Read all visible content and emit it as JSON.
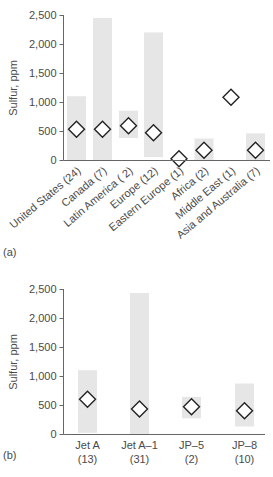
{
  "chart_data": [
    {
      "panel": "(a)",
      "type": "range-bar-with-marker",
      "title": "",
      "xlabel": "",
      "ylabel": "Sulfur, ppm",
      "ylim": [
        0,
        2500
      ],
      "yticks": [
        "0",
        "500",
        "1,000",
        "1,500",
        "2,000",
        "2,500"
      ],
      "yticks_values": [
        0,
        500,
        1000,
        1500,
        2000,
        2500
      ],
      "grid": false,
      "categories": [
        "United States (24)",
        "Canada (7)",
        "Latin America ( 2)",
        "Europe (12)",
        "Eastern Europe (1)",
        "Africa (2)",
        "Middle East (1)",
        "Asia and Australia (7)"
      ],
      "series": [
        {
          "name": "range_min",
          "values": [
            0,
            0,
            380,
            50,
            null,
            0,
            null,
            0
          ]
        },
        {
          "name": "range_max",
          "values": [
            1100,
            2450,
            850,
            2200,
            null,
            370,
            null,
            460
          ]
        },
        {
          "name": "average",
          "values": [
            530,
            530,
            590,
            470,
            20,
            170,
            1080,
            170
          ]
        }
      ]
    },
    {
      "panel": "(b)",
      "type": "range-bar-with-marker",
      "title": "",
      "xlabel": "",
      "ylabel": "Sulfur, ppm",
      "ylim": [
        0,
        2500
      ],
      "yticks": [
        "0",
        "500",
        "1,000",
        "1,500",
        "2,000",
        "2,500"
      ],
      "yticks_values": [
        0,
        500,
        1000,
        1500,
        2000,
        2500
      ],
      "grid": false,
      "categories": [
        "Jet A (13)",
        "Jet A–1 (31)",
        "JP–5 (2)",
        "JP–8 (10)"
      ],
      "category_lines": [
        [
          "Jet A",
          "(13)"
        ],
        [
          "Jet A–1",
          "(31)"
        ],
        [
          "JP–5",
          "(2)"
        ],
        [
          "JP–8",
          "(10)"
        ]
      ],
      "series": [
        {
          "name": "range_min",
          "values": [
            20,
            0,
            270,
            130
          ]
        },
        {
          "name": "range_max",
          "values": [
            1100,
            2430,
            640,
            870
          ]
        },
        {
          "name": "average",
          "values": [
            600,
            430,
            470,
            400
          ]
        }
      ]
    }
  ],
  "panels": {
    "a": {
      "label": "(a)",
      "ylabel": "Sulfur, ppm",
      "ytick_labels": [
        "0",
        "500",
        "1,000",
        "1,500",
        "2,000",
        "2,500"
      ],
      "categories": [
        "United States (24)",
        "Canada (7)",
        "Latin America ( 2)",
        "Europe (12)",
        "Eastern Europe (1)",
        "Africa (2)",
        "Middle East (1)",
        "Asia and Australia (7)"
      ]
    },
    "b": {
      "label": "(b)",
      "ylabel": "Sulfur, ppm",
      "ytick_labels": [
        "0",
        "500",
        "1,000",
        "1,500",
        "2,000",
        "2,500"
      ],
      "categories_line1": [
        "Jet A",
        "Jet A–1",
        "JP–5",
        "JP–8"
      ],
      "categories_line2": [
        "(13)",
        "(31)",
        "(2)",
        "(10)"
      ]
    }
  },
  "colors": {
    "bar_fill": "#e6e6e6",
    "axis": "#666666",
    "marker_stroke": "#222222",
    "marker_fill": "#ffffff",
    "text": "#4a4a4a"
  }
}
